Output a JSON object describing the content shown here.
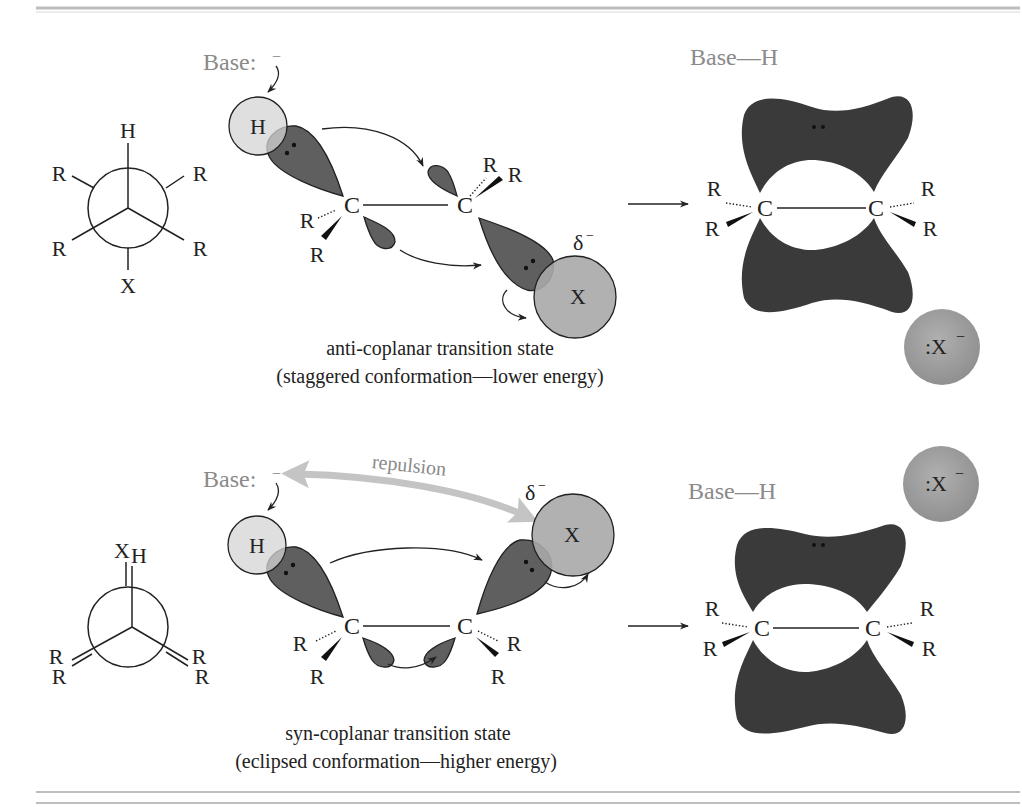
{
  "figure": {
    "colors": {
      "orbital": "#5f5f5f",
      "hydrogen": "#d4d4d4",
      "halogen": "#a8a8a8",
      "pi_cloud": "#3a3a3a",
      "base_text": "#8a8a8a",
      "repulsion_arrow": "#c4c4c4",
      "rule": "#bdbdbd"
    },
    "anti": {
      "newman": {
        "front_top": "H",
        "upper_left": "R",
        "upper_right": "R",
        "lower_left": "R",
        "lower_right": "R",
        "back_bottom": "X"
      },
      "ts": {
        "base_label": "Base:",
        "base_charge": "−",
        "h_label": "H",
        "c1": "C",
        "c2": "C",
        "x_label": "X",
        "delta": "δ",
        "delta_charge": "−",
        "r": "R"
      },
      "caption_line1": "anti-coplanar transition state",
      "caption_line2": "(staggered conformation—lower energy)",
      "product": {
        "base_h": "Base—H",
        "c1": "C",
        "c2": "C",
        "r": "R",
        "leaving_group": ":X",
        "leaving_charge": "−"
      }
    },
    "syn": {
      "newman": {
        "front_top_x": "X",
        "front_top_h": "H",
        "left_top": "R",
        "left_bottom": "R",
        "right_top": "R",
        "right_bottom": "R"
      },
      "ts": {
        "base_label": "Base:",
        "base_charge": "−",
        "repulsion": "repulsion",
        "h_label": "H",
        "c1": "C",
        "c2": "C",
        "x_label": "X",
        "delta": "δ",
        "delta_charge": "−",
        "r": "R"
      },
      "caption_line1": "syn-coplanar transition state",
      "caption_line2": "(eclipsed conformation—higher energy)",
      "product": {
        "base_h": "Base—H",
        "c1": "C",
        "c2": "C",
        "r": "R",
        "leaving_group": ":X",
        "leaving_charge": "−"
      }
    }
  }
}
